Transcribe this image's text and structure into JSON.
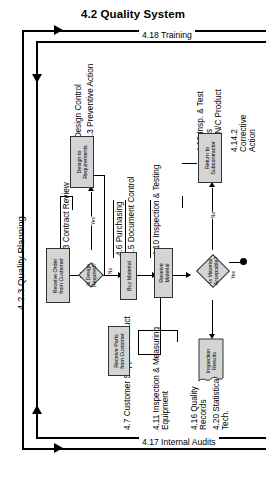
{
  "page": {
    "title": "4.2 Quality System",
    "background": "#ffffff",
    "node_fill": "#d4d4d4",
    "line_color": "#000000"
  },
  "frame": {
    "left_label": "4.2.3 Quality Planning",
    "top_label": "4.18 Training",
    "bottom_label": "4.17 Internal Audits"
  },
  "column_labels": {
    "contract_review": "4.3 Contract Review",
    "design_control": "4.4 Design Control",
    "preventive_action": "4.14.3 Preventive Action",
    "purchasing": "4.6 Purchasing",
    "document_control": "4.5 Document Control",
    "inspection_testing": "4.10 Inspection & Testing",
    "insp_test_status": "4.12 Insp. & Test Status",
    "nc_product": "4.13 N/C Product",
    "corrective_action": "4.14.2 Corrective Action",
    "customer_supplied_product": "4.7 Customer Supplied Product",
    "inspection_measuring_equipment": "4.11 Inspection & Measuring Equipment",
    "quality_records": "4.16 Quality Records",
    "statistical_tech": "4.20 Statistical Tech."
  },
  "nodes": {
    "receive_order": {
      "line1": "Receive Order",
      "line2": "from Customer"
    },
    "design_required": {
      "line1": "Is Design",
      "line2": "Required?"
    },
    "design_to_requirements": {
      "line1": "Design to",
      "line2": "Requirements"
    },
    "buy_material": {
      "line1": "Buy Material",
      "line2": ""
    },
    "receive_material": {
      "line1": "Receive",
      "line2": "Material"
    },
    "material_acceptable": {
      "line1": "Is Material",
      "line2": "Acceptable?"
    },
    "return_to_subcontractor": {
      "line1": "Return to",
      "line2": "Subcontractor"
    },
    "receive_parts": {
      "line1": "Receive Parts",
      "line2": "from Customer"
    },
    "inspection_results": {
      "line1": "Inspection",
      "line2": "Results"
    }
  },
  "edge_labels": {
    "design_yes": "Yes",
    "design_no": "No",
    "material_no": "No",
    "material_yes": "Yes"
  }
}
